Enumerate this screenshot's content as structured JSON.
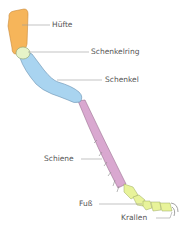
{
  "diagram": {
    "colors": {
      "huefte": "#f6b55a",
      "schenkelring": "#e6f3c8",
      "schenkel": "#a9d4f0",
      "schiene": "#d9a8d0",
      "fuss": "#e8f39a",
      "krallen": "#c8c8c8",
      "outline": "#7a8aa0",
      "leader": "#9a9a9a",
      "text": "#555555"
    },
    "labels": [
      {
        "id": "huefte",
        "text": "Hüfte"
      },
      {
        "id": "schenkelring",
        "text": "Schenkelring"
      },
      {
        "id": "schenkel",
        "text": "Schenkel"
      },
      {
        "id": "schiene",
        "text": "Schiene"
      },
      {
        "id": "fuss",
        "text": "Fuß"
      },
      {
        "id": "krallen",
        "text": "Krallen"
      }
    ]
  }
}
